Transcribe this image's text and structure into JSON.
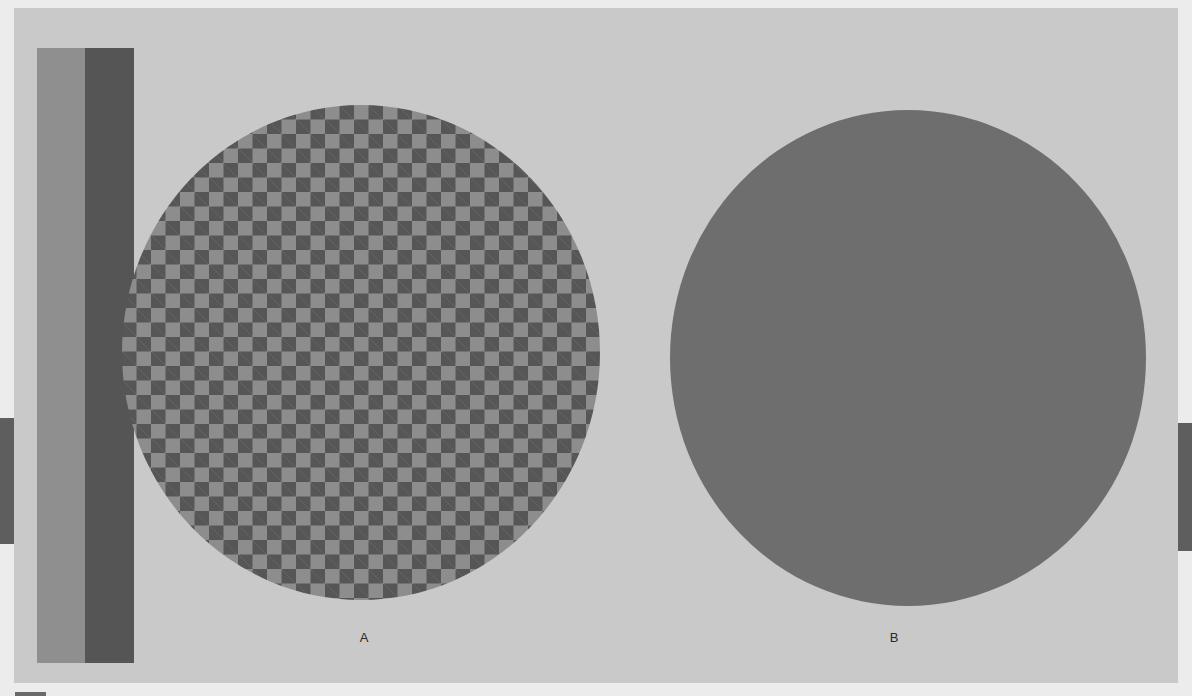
{
  "figure": {
    "labels": {
      "a": "A",
      "b": "B"
    },
    "colors": {
      "background": "#ececec",
      "panel": "#c9c9c9",
      "bar_light": "#8f8f8f",
      "bar_dark": "#555555",
      "checker_light": "#8d8d8d",
      "checker_dark": "#565656",
      "solid_circle": "#6e6e6e",
      "edge_strip": "#5e5e5e"
    },
    "elements": {
      "left_bars": [
        "light-gray-bar",
        "dark-gray-bar"
      ],
      "circle_a": "checkerboard-circle",
      "circle_b": "solid-gray-circle"
    }
  }
}
